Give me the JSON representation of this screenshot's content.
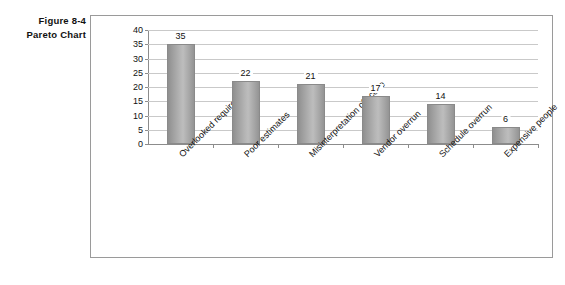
{
  "figure": {
    "caption_line1": "Figure 8-4",
    "caption_line2": "Pareto Chart"
  },
  "chart_data": {
    "type": "bar",
    "title": "",
    "subtitle": "",
    "xlabel": "",
    "ylabel": "",
    "ylim": [
      0,
      40
    ],
    "ytick_step": 5,
    "grid": true,
    "legend": false,
    "orientation": "vertical",
    "bar_color": "#b0b0b0",
    "categories": [
      "Overlooked requirement",
      "Poor estimates",
      "Misinterpretation of scope",
      "Vendor overrun",
      "Schedule overrun",
      "Expensive people"
    ],
    "values": [
      35,
      22,
      21,
      17,
      14,
      6
    ],
    "yticks": [
      0,
      5,
      10,
      15,
      20,
      25,
      30,
      35,
      40
    ],
    "ytick_labels": [
      "0",
      "5",
      "10",
      "15",
      "20",
      "25",
      "30",
      "35",
      "40"
    ],
    "value_labels": [
      "35",
      "22",
      "21",
      "17",
      "14",
      "6"
    ]
  }
}
